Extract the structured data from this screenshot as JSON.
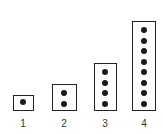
{
  "figure": {
    "columns": [
      {
        "label": "1",
        "dots": 1
      },
      {
        "label": "2",
        "dots": 2
      },
      {
        "label": "3",
        "dots": 4
      },
      {
        "label": "4",
        "dots": 8
      }
    ],
    "colors": {
      "dot": "#1a1a1a",
      "border": "#222222",
      "label": "#333333"
    }
  }
}
